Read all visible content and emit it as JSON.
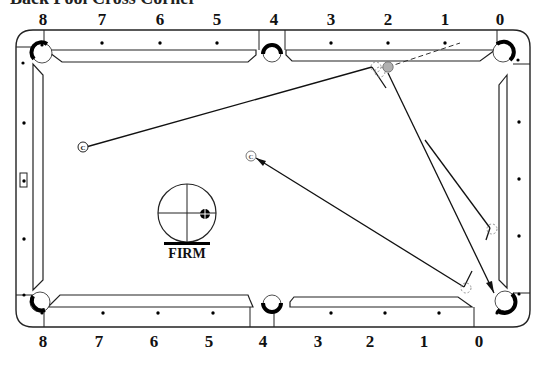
{
  "title": "Back Pool Cross Corner",
  "top_diamond_labels": [
    "8",
    "7",
    "6",
    "5",
    "4",
    "3",
    "2",
    "1",
    "0"
  ],
  "bottom_diamond_labels": [
    "8",
    "7",
    "6",
    "5",
    "4",
    "3",
    "2",
    "1",
    "0"
  ],
  "cue_tip": {
    "label": "FIRM",
    "hit_position": "right of center, slightly below horizontal"
  },
  "markers": {
    "cue_ball_symbol": "C",
    "object_ball_color": "#b0b0b0"
  },
  "shots": [
    {
      "name": "shot-1",
      "description": "Cue ball from left side to object ball near top rail right, object ball to bottom-right corner pocket"
    },
    {
      "name": "shot-2",
      "description": "Object ball from right rail kick back toward center cue ball position"
    }
  ],
  "colors": {
    "line": "#111111",
    "rail": "#222222",
    "ghost": "#888888",
    "background": "#ffffff"
  }
}
